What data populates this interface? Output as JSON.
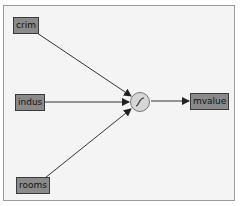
{
  "diagram": {
    "type": "neural-network",
    "inputs": [
      {
        "label": "crim"
      },
      {
        "label": "indus"
      },
      {
        "label": "rooms"
      }
    ],
    "activation": {
      "icon": "sigmoid-icon"
    },
    "output": {
      "label": "mvalue"
    },
    "colors": {
      "node_fill": "#8a8a8a",
      "node_border": "#3a3a3a",
      "edge": "#333333",
      "neuron_fill": "#d6d6d6",
      "background": "#f4f4f4"
    }
  }
}
